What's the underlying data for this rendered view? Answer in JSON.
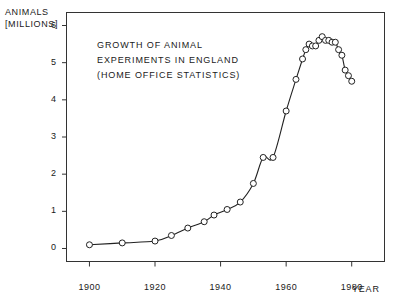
{
  "chart_data": {
    "type": "line",
    "title": "GROWTH OF ANIMAL EXPERIMENTS IN ENGLAND (HOME OFFICE STATISTICS)",
    "title_lines": [
      "GROWTH OF ANIMAL",
      "EXPERIMENTS IN ENGLAND",
      "(HOME OFFICE STATISTICS)"
    ],
    "ylabel": "ANIMALS [MILLIONS]",
    "ylabel_lines": [
      "ANIMALS",
      "[MILLIONS]"
    ],
    "xlabel": "YEAR",
    "xlim": [
      1893,
      1990
    ],
    "ylim": [
      -0.35,
      6.35
    ],
    "grid": false,
    "legend": null,
    "marker": "open-circle",
    "xticks": [
      1900,
      1920,
      1940,
      1960,
      1980
    ],
    "xtick_labels": [
      "1900",
      "1920",
      "1940",
      "1960",
      "1980"
    ],
    "yticks": [
      0,
      1,
      2,
      3,
      4,
      5,
      6
    ],
    "ytick_labels": [
      "0",
      "1",
      "2",
      "3",
      "4",
      "5",
      "6"
    ],
    "x": [
      1900,
      1910,
      1920,
      1925,
      1930,
      1935,
      1938,
      1942,
      1946,
      1950,
      1953,
      1956,
      1960,
      1963,
      1965,
      1966,
      1967,
      1968,
      1969,
      1970,
      1971,
      1972,
      1973,
      1974,
      1975,
      1976,
      1977,
      1978,
      1979,
      1980
    ],
    "y": [
      0.1,
      0.15,
      0.2,
      0.35,
      0.55,
      0.72,
      0.9,
      1.05,
      1.25,
      1.75,
      2.45,
      2.45,
      3.7,
      4.55,
      5.1,
      5.35,
      5.5,
      5.45,
      5.45,
      5.6,
      5.7,
      5.6,
      5.6,
      5.55,
      5.55,
      5.35,
      5.2,
      4.8,
      4.65,
      4.5
    ]
  }
}
